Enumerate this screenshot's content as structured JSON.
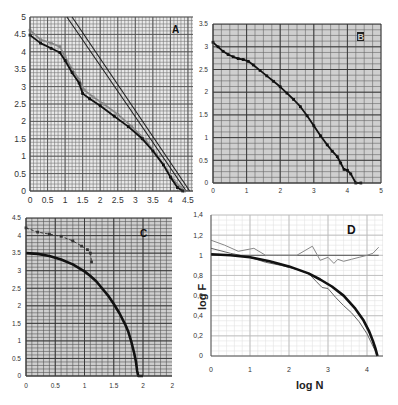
{
  "figure": {
    "title": ""
  },
  "chart_data": [
    {
      "id": "A",
      "panel_label": "A",
      "type": "line",
      "title": "",
      "xlabel": "",
      "ylabel": "",
      "xlim": [
        0,
        4.6
      ],
      "ylim": [
        0,
        5
      ],
      "xticks": [
        "0",
        "0.5",
        "1",
        "1.5",
        "2",
        "2.5",
        "3",
        "3.5",
        "4",
        "4.5"
      ],
      "yticks": [
        "0",
        "0.5",
        "1",
        "1.5",
        "2",
        "2.5",
        "3",
        "3.5",
        "4",
        "4.5",
        "5"
      ],
      "grid": true,
      "series": [
        {
          "name": "straight line 1",
          "style": "line",
          "color": "#222222",
          "x": [
            1.05,
            4.45
          ],
          "y": [
            5.0,
            0.0
          ]
        },
        {
          "name": "straight line 2",
          "style": "line",
          "color": "#222222",
          "x": [
            1.2,
            4.55
          ],
          "y": [
            5.0,
            0.0
          ]
        },
        {
          "name": "data series (gray)",
          "style": "markers",
          "color": "#888888",
          "x": [
            0.0,
            0.3,
            0.6,
            0.85,
            1.0,
            1.2,
            1.4,
            1.55,
            1.8,
            2.1,
            2.5,
            2.9,
            3.3,
            3.6,
            3.9,
            4.1,
            4.3,
            4.4
          ],
          "y": [
            4.62,
            4.35,
            4.25,
            4.15,
            3.85,
            3.5,
            3.2,
            2.9,
            2.7,
            2.5,
            2.2,
            1.85,
            1.45,
            1.05,
            0.6,
            0.3,
            0.1,
            0.0
          ]
        },
        {
          "name": "data series (black)",
          "style": "markers",
          "color": "#111111",
          "x": [
            0.0,
            0.3,
            0.6,
            0.85,
            1.0,
            1.2,
            1.4,
            1.5,
            1.7,
            2.0,
            2.4,
            2.8,
            3.2,
            3.5,
            3.8,
            4.0,
            4.2,
            4.35
          ],
          "y": [
            4.48,
            4.25,
            4.1,
            3.98,
            3.75,
            3.4,
            3.1,
            2.8,
            2.65,
            2.45,
            2.15,
            1.85,
            1.5,
            1.15,
            0.75,
            0.4,
            0.1,
            0.0
          ]
        }
      ]
    },
    {
      "id": "B",
      "panel_label": "B",
      "type": "scatter",
      "title": "",
      "xlabel": "",
      "ylabel": "",
      "xlim": [
        0,
        5
      ],
      "ylim": [
        0,
        3.5
      ],
      "xticks": [
        "0",
        "1",
        "2",
        "3",
        "4",
        "5"
      ],
      "yticks": [
        "0",
        "0.5",
        "1",
        "1.5",
        "2",
        "2.5",
        "3",
        "3.5"
      ],
      "grid": true,
      "series": [
        {
          "name": "data",
          "style": "markers",
          "color": "#111111",
          "x": [
            0.0,
            0.15,
            0.3,
            0.45,
            0.6,
            0.75,
            0.9,
            1.05,
            1.2,
            1.4,
            1.6,
            1.8,
            2.0,
            2.2,
            2.4,
            2.6,
            2.8,
            3.0,
            3.2,
            3.4,
            3.55,
            3.7,
            3.8,
            3.9,
            4.0,
            4.1,
            4.25,
            4.4
          ],
          "y": [
            3.1,
            3.0,
            2.9,
            2.83,
            2.78,
            2.74,
            2.72,
            2.68,
            2.6,
            2.48,
            2.36,
            2.24,
            2.12,
            1.98,
            1.84,
            1.68,
            1.48,
            1.26,
            1.04,
            0.84,
            0.7,
            0.58,
            0.44,
            0.3,
            0.28,
            0.2,
            0.0,
            0.0
          ]
        }
      ]
    },
    {
      "id": "C",
      "panel_label": "C",
      "type": "line",
      "title": "",
      "xlabel": "",
      "ylabel": "",
      "xlim": [
        0,
        2.5
      ],
      "ylim": [
        0,
        4.5
      ],
      "xticks": [
        "0",
        "0.5",
        "1",
        "1.5",
        "2",
        "2"
      ],
      "yticks": [
        "0",
        "0.5",
        "1",
        "1.5",
        "2",
        "2.5",
        "3",
        "3.5",
        "4",
        "4.5"
      ],
      "grid": true,
      "series": [
        {
          "name": "upper dashed series",
          "style": "dashed-markers",
          "color": "#333333",
          "x": [
            0.0,
            0.2,
            0.4,
            0.6,
            0.8,
            0.95,
            1.05,
            1.1,
            1.12
          ],
          "y": [
            4.22,
            4.1,
            4.04,
            3.98,
            3.85,
            3.7,
            3.6,
            3.5,
            3.25
          ]
        },
        {
          "name": "main curve",
          "style": "thick-line",
          "color": "#111111",
          "x": [
            0.0,
            0.2,
            0.4,
            0.6,
            0.8,
            1.0,
            1.1,
            1.2,
            1.3,
            1.4,
            1.5,
            1.6,
            1.7,
            1.75,
            1.8,
            1.85,
            1.88,
            1.9,
            1.92,
            1.96,
            2.0
          ],
          "y": [
            3.5,
            3.48,
            3.42,
            3.32,
            3.18,
            2.98,
            2.85,
            2.7,
            2.5,
            2.3,
            2.05,
            1.78,
            1.45,
            1.25,
            0.98,
            0.65,
            0.4,
            0.15,
            0.0,
            0.0,
            0.0
          ]
        }
      ]
    },
    {
      "id": "D",
      "panel_label": "D",
      "type": "line",
      "title": "",
      "xlabel": "log N",
      "ylabel": "log F",
      "xlim": [
        0,
        4.4
      ],
      "ylim": [
        0,
        1.4
      ],
      "xticks": [
        "0",
        "1",
        "2",
        "3",
        "4"
      ],
      "yticks": [
        "0",
        "0,2",
        "0,4",
        "0,6",
        "0,8",
        "1",
        "1,2",
        "1,4"
      ],
      "grid": true,
      "series": [
        {
          "name": "reference line y=1",
          "style": "thin-line",
          "color": "#555555",
          "x": [
            0.0,
            4.3
          ],
          "y": [
            1.0,
            1.0
          ]
        },
        {
          "name": "noisy ratio (gray)",
          "style": "thin-line",
          "color": "#888888",
          "x": [
            0.0,
            0.35,
            0.7,
            1.1,
            1.4,
            1.7,
            2.0,
            2.2,
            2.6,
            2.8,
            3.0,
            3.15,
            3.25,
            3.4,
            3.6,
            3.8,
            4.0,
            4.15,
            4.3
          ],
          "y": [
            1.15,
            1.1,
            1.04,
            1.07,
            1.0,
            1.0,
            1.0,
            1.0,
            1.09,
            0.95,
            0.98,
            0.92,
            0.96,
            0.94,
            0.96,
            0.98,
            1.0,
            1.02,
            1.08
          ]
        },
        {
          "name": "second gray curve",
          "style": "thin-line",
          "color": "#666666",
          "x": [
            0.0,
            0.5,
            1.0,
            1.4,
            1.8,
            2.2,
            2.5,
            2.7,
            2.85,
            3.0,
            3.2,
            3.4,
            3.6,
            3.8,
            4.0,
            4.1,
            4.2,
            4.25
          ],
          "y": [
            1.07,
            1.02,
            0.98,
            0.93,
            0.9,
            0.86,
            0.82,
            0.74,
            0.68,
            0.67,
            0.58,
            0.5,
            0.43,
            0.34,
            0.22,
            0.14,
            0.06,
            0.0
          ]
        },
        {
          "name": "fit curve (thick black)",
          "style": "thick-line",
          "color": "#111111",
          "x": [
            0.0,
            0.5,
            1.0,
            1.5,
            2.0,
            2.5,
            2.8,
            3.1,
            3.4,
            3.7,
            3.9,
            4.05,
            4.15,
            4.22,
            4.27
          ],
          "y": [
            1.01,
            1.0,
            0.98,
            0.94,
            0.89,
            0.82,
            0.76,
            0.69,
            0.6,
            0.47,
            0.36,
            0.25,
            0.15,
            0.07,
            0.0
          ]
        }
      ]
    }
  ]
}
